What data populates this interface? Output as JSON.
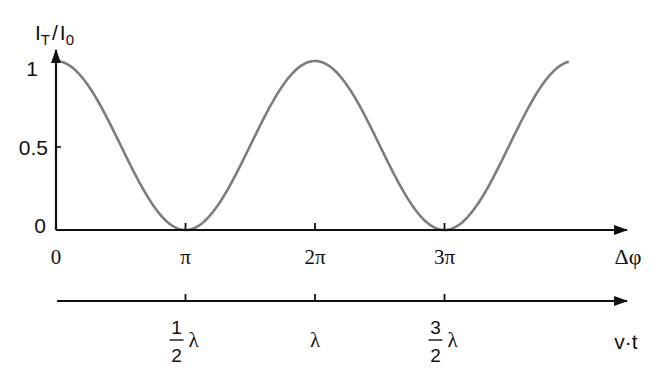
{
  "chart_data": {
    "type": "line",
    "title": "",
    "ylabel": "I_T / I_0",
    "ylabel_main": "I",
    "ylabel_sub1": "T",
    "ylabel_sep": "/",
    "ylabel_sub2": "0",
    "xlabel": "Δφ",
    "xlabel2": "v·t",
    "ylim": [
      0,
      1
    ],
    "xlim_pi": [
      0,
      4
    ],
    "y_ticks": [
      {
        "value": 0,
        "label": "0"
      },
      {
        "value": 0.5,
        "label": "0.5"
      },
      {
        "value": 1,
        "label": "1"
      }
    ],
    "x_ticks": [
      {
        "value_pi": 0,
        "label": "0"
      },
      {
        "value_pi": 1,
        "label": "π"
      },
      {
        "value_pi": 2,
        "label": "2π"
      },
      {
        "value_pi": 3,
        "label": "3π"
      }
    ],
    "x2_ticks": [
      {
        "value_pi": 1,
        "num": "1",
        "den": "2",
        "unit": "λ"
      },
      {
        "value_pi": 2,
        "num": "",
        "den": "",
        "unit": "λ"
      },
      {
        "value_pi": 3,
        "num": "3",
        "den": "2",
        "unit": "λ"
      }
    ],
    "series": [
      {
        "name": "I_T/I_0",
        "function": "cos^2(Δφ/2)",
        "x_pi": [
          0,
          0.5,
          1,
          1.5,
          2,
          2.5,
          3,
          3.5,
          3.96
        ],
        "values": [
          1,
          0.5,
          0,
          0.5,
          1,
          0.5,
          0,
          0.5,
          1
        ],
        "color": "#808080"
      }
    ],
    "grid": false,
    "legend": "none"
  }
}
